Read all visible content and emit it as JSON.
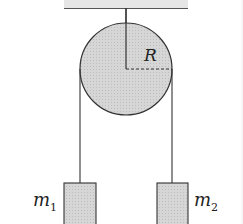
{
  "diagram": {
    "pulley": {
      "radius_label": "R"
    },
    "masses": [
      {
        "label": "m",
        "subscript": "1"
      },
      {
        "label": "m",
        "subscript": "2"
      }
    ],
    "colors": {
      "fill": "#d4d4d4",
      "stroke": "#333333"
    }
  }
}
